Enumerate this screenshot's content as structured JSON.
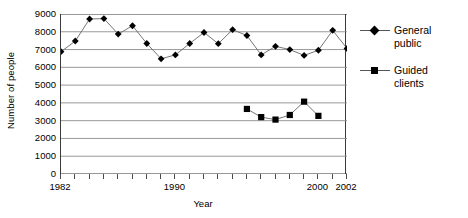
{
  "chart_data": {
    "type": "line",
    "title": "",
    "xlabel": "Year",
    "ylabel": "Number of people",
    "xlim": [
      1982,
      2002
    ],
    "ylim": [
      0,
      9000
    ],
    "ytick_values": [
      0,
      1000,
      2000,
      3000,
      4000,
      5000,
      6000,
      7000,
      8000,
      9000
    ],
    "ytick_labels": [
      "0",
      "1000",
      "2000",
      "3000",
      "4000",
      "5000",
      "6000",
      "7000",
      "8000",
      "9000"
    ],
    "xtick_values": [
      1982,
      1983,
      1984,
      1985,
      1986,
      1987,
      1988,
      1989,
      1990,
      1991,
      1992,
      1993,
      1994,
      1995,
      1996,
      1997,
      1998,
      1999,
      2000,
      2001,
      2002
    ],
    "xtick_labeled": [
      {
        "value": 1982,
        "label": "1982"
      },
      {
        "value": 1990,
        "label": "1990"
      },
      {
        "value": 2000,
        "label": "2000"
      },
      {
        "value": 2002,
        "label": "2002"
      }
    ],
    "grid": {
      "horizontal": true,
      "vertical": false
    },
    "legend_position": "right",
    "series": [
      {
        "name": "General public",
        "marker": "diamond",
        "color": "#000000",
        "x": [
          1982,
          1983,
          1984,
          1985,
          1986,
          1987,
          1988,
          1989,
          1990,
          1991,
          1992,
          1993,
          1994,
          1995,
          1996,
          1997,
          1998,
          1999,
          2000,
          2001,
          2002
        ],
        "values": [
          6880,
          7480,
          8720,
          8740,
          7870,
          8340,
          7340,
          6480,
          6700,
          7340,
          7960,
          7330,
          8120,
          7790,
          6700,
          7180,
          7000,
          6670,
          6960,
          8080,
          7060
        ]
      },
      {
        "name": "Guided clients",
        "marker": "square",
        "color": "#000000",
        "x": [
          1995,
          1996,
          1997,
          1998,
          1999,
          2000,
          2001
        ],
        "values": [
          3660,
          3200,
          3060,
          3320,
          4070,
          3270,
          null
        ]
      }
    ]
  },
  "legend": {
    "items": [
      {
        "label": "General\npublic",
        "marker": "diamond"
      },
      {
        "label": "Guided\nclients",
        "marker": "square"
      }
    ]
  },
  "axes": {
    "y_title": "Number of people",
    "x_title": "Year"
  }
}
